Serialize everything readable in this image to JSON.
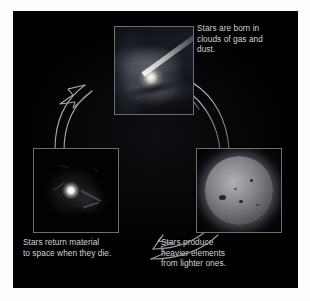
{
  "diagram": {
    "background_color": "#000000",
    "page_color": "#ffffff",
    "caption_color": "#d2d2d0",
    "stages": [
      {
        "id": "birth",
        "caption": "Stars are born in\nclouds of gas and\ndust.",
        "image_name": "protostar-nebula-with-jet-photo",
        "position": "top"
      },
      {
        "id": "return",
        "caption": "Stars return material\nto space when they die.",
        "image_name": "dying-star-ejecting-material-photo",
        "position": "bottom-left"
      },
      {
        "id": "produce",
        "caption": "Stars produce\nheavier elements\nfrom lighter ones.",
        "image_name": "star-sphere-with-sunspots-photo",
        "position": "bottom-right"
      }
    ],
    "arrows": [
      {
        "id": "produce-to-return",
        "direction": "right-to-left",
        "position": "bottom"
      },
      {
        "id": "return-to-birth",
        "direction": "up-right",
        "position": "left"
      },
      {
        "id": "birth-to-produce",
        "direction": "down-right",
        "position": "right"
      }
    ]
  }
}
